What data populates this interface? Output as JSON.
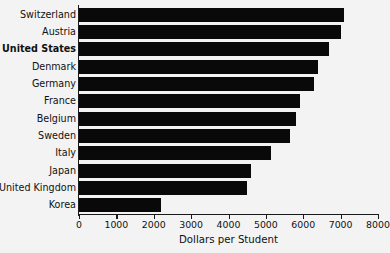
{
  "chart_data": {
    "type": "bar",
    "orientation": "horizontal",
    "title": "",
    "xlabel": "Dollars per Student",
    "ylabel": "",
    "xlim": [
      0,
      8000
    ],
    "xticks": [
      0,
      1000,
      2000,
      3000,
      4000,
      5000,
      6000,
      7000,
      8000
    ],
    "xtick_labels": [
      "0",
      "1000",
      "2000",
      "3000",
      "4000",
      "5000",
      "6000",
      "7000",
      "8000"
    ],
    "grid": false,
    "legend": null,
    "bar_color": "#090909",
    "background_color": "#f3f3f3",
    "axis_color": "#1a1a1a",
    "categories": [
      "Switzerland",
      "Austria",
      "United States",
      "Denmark",
      "Germany",
      "France",
      "Belgium",
      "Sweden",
      "Italy",
      "Japan",
      "United Kingdom",
      "Korea"
    ],
    "values": [
      7100,
      7000,
      6700,
      6400,
      6300,
      5900,
      5800,
      5650,
      5150,
      4600,
      4500,
      2200
    ],
    "highlighted_categories": [
      "United States"
    ],
    "series": [
      {
        "name": "Dollars per Student",
        "values": [
          7100,
          7000,
          6700,
          6400,
          6300,
          5900,
          5800,
          5650,
          5150,
          4600,
          4500,
          2200
        ]
      }
    ]
  }
}
